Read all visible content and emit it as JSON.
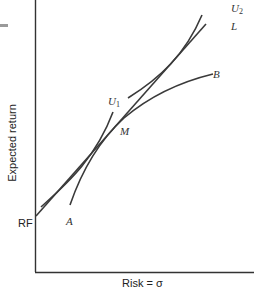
{
  "diagram": {
    "type": "capital market line with indifference curves",
    "axes": {
      "x_label": "Risk = σ",
      "y_label": "Expected return"
    },
    "points": {
      "rf_label": "RF",
      "m_label": "M"
    },
    "curves": {
      "a_label": "A",
      "b_label": "B",
      "u1_label": "U",
      "u1_sub": "1",
      "u2_label": "U",
      "u2_sub": "2",
      "l_label": "L"
    },
    "colors": {
      "line": "#3a3a3a",
      "axis": "#333333",
      "background": "#ffffff"
    }
  }
}
